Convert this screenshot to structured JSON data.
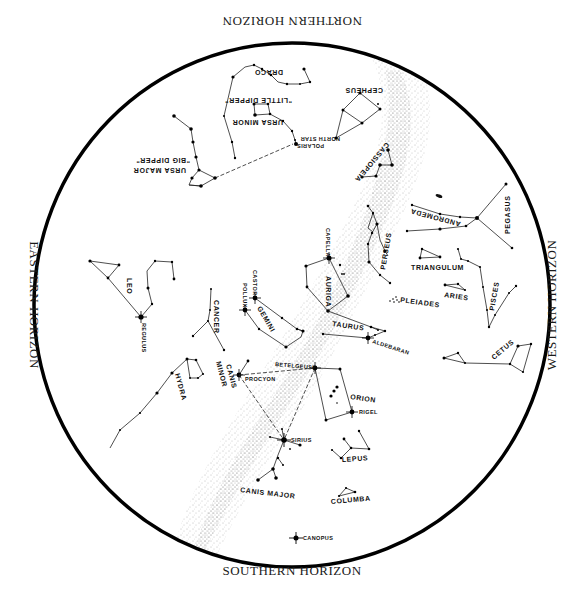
{
  "horizons": {
    "north": "NORTHERN HORIZON",
    "south": "SOUTHERN HORIZON",
    "east": "EASTERN HORIZON",
    "west": "WESTERN HORIZON"
  },
  "colors": {
    "ink": "#111111",
    "background": "#ffffff",
    "milky_way": "#9a9a9a"
  },
  "constellations": {
    "draco": "DRACO",
    "little_dipper": "\"LITTLE DIPPER\"",
    "ursa_minor": "URSA MINOR",
    "big_dipper": "\"BIG DIPPER\"",
    "ursa_major": "URSA MAJOR",
    "cepheus": "CEPHEUS",
    "cassiopeia": "CASSIOPEIA",
    "andromeda": "ANDROMEDA",
    "pegasus": "PEGASUS",
    "perseus": "PERSEUS",
    "auriga": "AURIGA",
    "triangulum": "TRIANGULUM",
    "aries": "ARIES",
    "pisces": "PISCES",
    "pleiades": "PLEIADES",
    "taurus": "TAURUS",
    "cetus": "CETUS",
    "gemini": "GEMINI",
    "cancer": "CANCER",
    "leo": "LEO",
    "hydra": "HYDRA",
    "canis_minor_1": "CANIS",
    "canis_minor_2": "MINOR",
    "orion": "ORION",
    "lepus": "LEPUS",
    "canis_major": "CANIS MAJOR",
    "columba": "COLUMBA"
  },
  "stars": {
    "polaris": "POLARIS",
    "north_star": "NORTH STAR",
    "capella": "CAPELLA",
    "castor": "CASTOR",
    "pollux": "POLLUX",
    "regulus": "REGULUS",
    "aldebaran": "ALDEBARAN",
    "betelgeuse": "BETELGEUSE",
    "procyon": "PROCYON",
    "rigel": "RIGEL",
    "sirius": "SIRIUS",
    "canopus": "CANOPUS"
  }
}
